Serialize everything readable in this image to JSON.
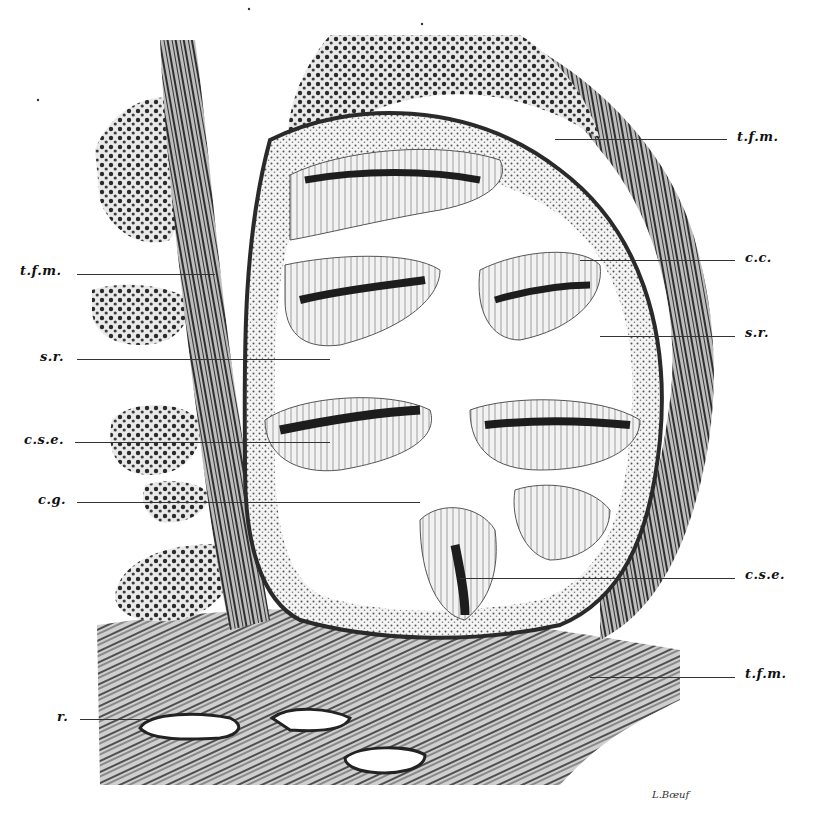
{
  "figure": {
    "type": "histological section illustration",
    "signature": "L.Bœuf",
    "labels_right": [
      {
        "id": "tfm-top",
        "text": "t.f.m.",
        "x": 737,
        "y": 131,
        "line_from": 555,
        "line_to": 727
      },
      {
        "id": "cc",
        "text": "c.c.",
        "x": 745,
        "y": 252,
        "line_from": 580,
        "line_to": 735
      },
      {
        "id": "sr-right",
        "text": "s.r.",
        "x": 745,
        "y": 322,
        "line_from": 600,
        "line_to": 735
      },
      {
        "id": "cse-right",
        "text": "c.s.e.",
        "x": 745,
        "y": 569,
        "line_from": 460,
        "line_to": 735
      },
      {
        "id": "tfm-bottom",
        "text": "t.f.m.",
        "x": 745,
        "y": 668,
        "line_from": 590,
        "line_to": 735
      }
    ],
    "labels_left": [
      {
        "id": "tfm-left",
        "text": "t.f.m.",
        "x": 20,
        "y": 265,
        "line_from": 77,
        "line_to": 215
      },
      {
        "id": "sr-left",
        "text": "s.r.",
        "x": 42,
        "y": 350,
        "line_from": 77,
        "line_to": 330
      },
      {
        "id": "cse-left",
        "text": "c.s.e.",
        "x": 26,
        "y": 434,
        "line_from": 75,
        "line_to": 330
      },
      {
        "id": "cg",
        "text": "c.g.",
        "x": 40,
        "y": 494,
        "line_from": 77,
        "line_to": 420
      },
      {
        "id": "r",
        "text": "r.",
        "x": 57,
        "y": 711,
        "line_from": 80,
        "line_to": 150
      }
    ]
  }
}
